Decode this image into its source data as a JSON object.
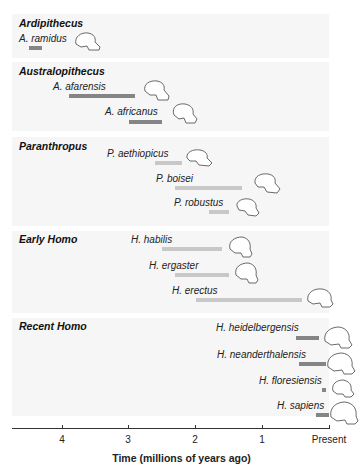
{
  "chart_data": {
    "type": "bar",
    "subtype": "horizontal-range-timeline",
    "title": "",
    "xlabel": "Time (millions of years ago)",
    "ylabel": "",
    "x_ticks": [
      "4",
      "3",
      "2",
      "1",
      "Present"
    ],
    "x_tick_values": [
      4,
      3,
      2,
      1,
      0
    ],
    "xlim": [
      4.75,
      0
    ],
    "grid": false,
    "legend": null,
    "colors": {
      "dark_bar": "#858585",
      "light_bar": "#c8c8c8",
      "band_bg": "#f6f6f6",
      "axis": "#333333"
    },
    "groups": [
      {
        "name": "Ardipithecus",
        "species": [
          {
            "name": "A. ramidus",
            "start_mya": 4.5,
            "end_mya": 4.3
          }
        ]
      },
      {
        "name": "Australopithecus",
        "species": [
          {
            "name": "A. afarensis",
            "start_mya": 3.9,
            "end_mya": 2.9
          },
          {
            "name": "A. africanus",
            "start_mya": 3.0,
            "end_mya": 2.5
          }
        ]
      },
      {
        "name": "Paranthropus",
        "species": [
          {
            "name": "P. aethiopicus",
            "start_mya": 2.6,
            "end_mya": 2.2
          },
          {
            "name": "P. boisei",
            "start_mya": 2.3,
            "end_mya": 1.3
          },
          {
            "name": "P. robustus",
            "start_mya": 1.8,
            "end_mya": 1.5
          }
        ]
      },
      {
        "name": "Early Homo",
        "species": [
          {
            "name": "H. habilis",
            "start_mya": 2.5,
            "end_mya": 1.6
          },
          {
            "name": "H. ergaster",
            "start_mya": 2.3,
            "end_mya": 1.5
          },
          {
            "name": "H. erectus",
            "start_mya": 2.0,
            "end_mya": 0.4
          }
        ]
      },
      {
        "name": "Recent Homo",
        "species": [
          {
            "name": "H. heidelbergensis",
            "start_mya": 0.5,
            "end_mya": 0.15
          },
          {
            "name": "H. neanderthalensis",
            "start_mya": 0.45,
            "end_mya": 0.05
          },
          {
            "name": "H. floresiensis",
            "start_mya": 0.1,
            "end_mya": 0.05
          },
          {
            "name": "H. sapiens",
            "start_mya": 0.2,
            "end_mya": 0.0
          }
        ]
      }
    ]
  }
}
